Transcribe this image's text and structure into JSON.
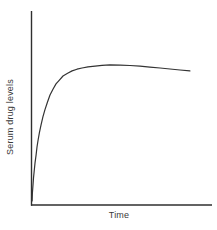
{
  "figure": {
    "background_color": "#ffffff",
    "axis_color": "#2f2f2f",
    "curve_color": "#333333",
    "text_color": "#3a3a3a"
  },
  "chart_data": {
    "type": "line",
    "title": "",
    "xlabel": "Time",
    "ylabel": "Serum drug levels",
    "x_tick_labels": [],
    "y_tick_labels": [],
    "grid": false,
    "legend": null,
    "axes_numeric": false,
    "series": [
      {
        "name": "Serum drug level",
        "x_units": "normalized 0-1 fraction of Time axis",
        "y_units": "normalized 0-1 fraction of y-axis height",
        "points_normalized": [
          [
            0.006,
            0.021
          ],
          [
            0.008,
            0.062
          ],
          [
            0.011,
            0.103
          ],
          [
            0.014,
            0.139
          ],
          [
            0.017,
            0.17
          ],
          [
            0.022,
            0.216
          ],
          [
            0.028,
            0.258
          ],
          [
            0.033,
            0.299
          ],
          [
            0.039,
            0.335
          ],
          [
            0.047,
            0.376
          ],
          [
            0.055,
            0.412
          ],
          [
            0.066,
            0.454
          ],
          [
            0.077,
            0.49
          ],
          [
            0.091,
            0.531
          ],
          [
            0.105,
            0.567
          ],
          [
            0.122,
            0.598
          ],
          [
            0.138,
            0.624
          ],
          [
            0.157,
            0.644
          ],
          [
            0.177,
            0.665
          ],
          [
            0.202,
            0.679
          ],
          [
            0.227,
            0.691
          ],
          [
            0.254,
            0.7
          ],
          [
            0.282,
            0.706
          ],
          [
            0.315,
            0.712
          ],
          [
            0.354,
            0.716
          ],
          [
            0.392,
            0.72
          ],
          [
            0.436,
            0.722
          ],
          [
            0.492,
            0.721
          ],
          [
            0.547,
            0.719
          ],
          [
            0.602,
            0.716
          ],
          [
            0.657,
            0.711
          ],
          [
            0.713,
            0.706
          ],
          [
            0.768,
            0.701
          ],
          [
            0.823,
            0.696
          ],
          [
            0.878,
            0.691
          ]
        ]
      }
    ]
  }
}
